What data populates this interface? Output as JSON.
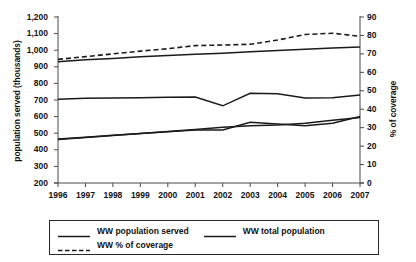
{
  "chart_data": {
    "type": "line",
    "title": "",
    "xlabel": "",
    "ylabel": "population served (thousands)",
    "ylabel_right": "% of coverage",
    "grid": false,
    "legend_position": "bottom",
    "x": [
      1996,
      1997,
      1998,
      1999,
      2000,
      2001,
      2002,
      2003,
      2004,
      2005,
      2006,
      2007
    ],
    "categories": [
      "1996",
      "1997",
      "1998",
      "1999",
      "2000",
      "2001",
      "2002",
      "2003",
      "2004",
      "2005",
      "2006",
      "2007"
    ],
    "ylim": [
      200,
      1200
    ],
    "yticks": [
      "200",
      "300",
      "400",
      "500",
      "600",
      "700",
      "800",
      "900",
      "1,000",
      "1,100",
      "1,200"
    ],
    "ylim_right": [
      0,
      90
    ],
    "yticks_right": [
      "0",
      "10",
      "20",
      "30",
      "40",
      "50",
      "60",
      "70",
      "80",
      "90"
    ],
    "series": [
      {
        "name": "WW total population",
        "axis": "left",
        "style": "solid",
        "color": "#1a1a1a",
        "values": [
          930,
          942,
          950,
          960,
          968,
          975,
          982,
          990,
          998,
          1006,
          1013,
          1020
        ]
      },
      {
        "name": "WW population served",
        "axis": "left",
        "style": "solid",
        "color": "#1a1a1a",
        "values": [
          705,
          710,
          712,
          714,
          716,
          718,
          665,
          740,
          738,
          712,
          714,
          730
        ]
      },
      {
        "name": "WW total population (lower trend)",
        "axis": "left",
        "style": "solid",
        "color": "#1a1a1a",
        "values": [
          465,
          476,
          487,
          498,
          509,
          520,
          520,
          566,
          556,
          545,
          560,
          600
        ]
      },
      {
        "name": "WW population served (lower trend)",
        "axis": "left",
        "style": "solid",
        "color": "#1a1a1a",
        "values": [
          462,
          474,
          486,
          498,
          510,
          522,
          536,
          545,
          550,
          560,
          578,
          595
        ]
      },
      {
        "name": "WW % of coverage",
        "axis": "right",
        "style": "dashed",
        "color": "#1a1a1a",
        "values": [
          67.0,
          68.5,
          70.0,
          71.5,
          72.8,
          74.5,
          74.8,
          75.2,
          77.5,
          80.5,
          81.2,
          79.5
        ]
      }
    ]
  },
  "legend": {
    "items": [
      {
        "label": "WW population served",
        "style": "solid"
      },
      {
        "label": "WW total population",
        "style": "solid"
      },
      {
        "label": "WW % of coverage",
        "style": "dashed"
      }
    ]
  },
  "axes": {
    "left_title": "population served (thousands)",
    "right_title": "% of coverage"
  }
}
